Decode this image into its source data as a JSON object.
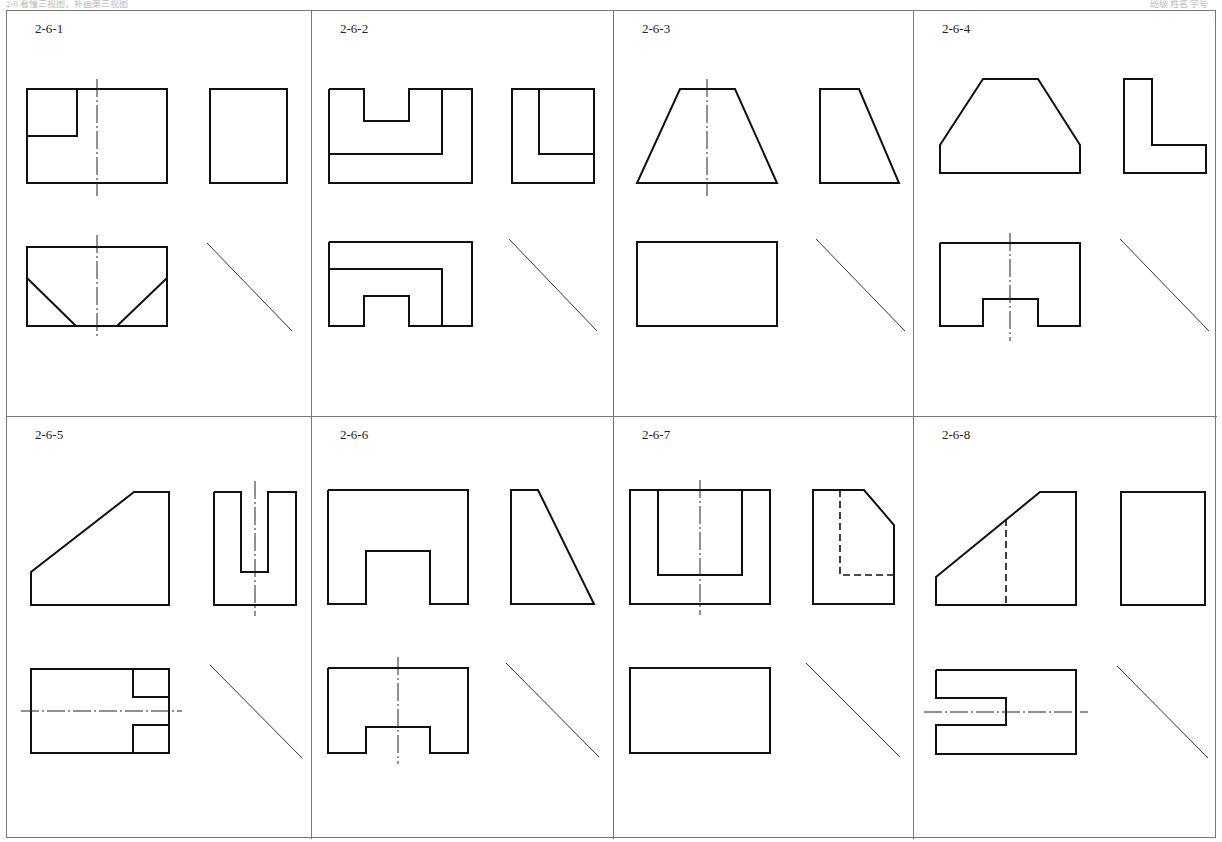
{
  "header": {
    "left_text": "2-6 看懂三视图，补画第三视图",
    "right_text": "班级 姓名 学号"
  },
  "panels": [
    {
      "id": "2-6-1",
      "label": "2-6-1"
    },
    {
      "id": "2-6-2",
      "label": "2-6-2"
    },
    {
      "id": "2-6-3",
      "label": "2-6-3"
    },
    {
      "id": "2-6-4",
      "label": "2-6-4"
    },
    {
      "id": "2-6-5",
      "label": "2-6-5"
    },
    {
      "id": "2-6-6",
      "label": "2-6-6"
    },
    {
      "id": "2-6-7",
      "label": "2-6-7"
    },
    {
      "id": "2-6-8",
      "label": "2-6-8"
    }
  ]
}
